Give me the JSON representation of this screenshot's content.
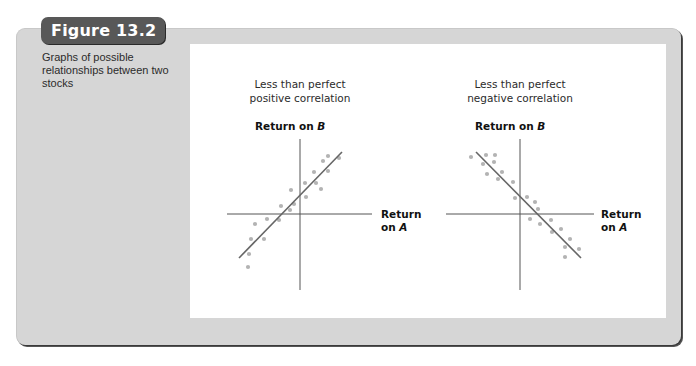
{
  "figure": {
    "badge": "Figure 13.2",
    "caption": "Graphs of possible relationships between two stocks"
  },
  "colors": {
    "frame": "#d6d6d6",
    "badge": "#585858",
    "axis": "#555555",
    "fit_line": "#666666",
    "points": "#b3b3b3"
  },
  "charts": [
    {
      "title_line1": "Less than perfect",
      "title_line2": "positive correlation",
      "ylabel_prefix": "Return on ",
      "ylabel_var": "B",
      "xlabel_line1": "Return",
      "xlabel_prefix": "on ",
      "xlabel_var": "A"
    },
    {
      "title_line1": "Less than perfect",
      "title_line2": "negative correlation",
      "ylabel_prefix": "Return on ",
      "ylabel_var": "B",
      "xlabel_line1": "Return",
      "xlabel_prefix": "on ",
      "xlabel_var": "A"
    }
  ],
  "chart_data": [
    {
      "type": "scatter",
      "title": "Less than perfect positive correlation",
      "xlabel": "Return on A",
      "ylabel": "Return on B",
      "grid": false,
      "origin_px": [
        300,
        214
      ],
      "x_axis_px": [
        227,
        372
      ],
      "y_axis_px": [
        139,
        290
      ],
      "fit_line_px": [
        [
          239,
          258
        ],
        [
          342,
          152
        ]
      ],
      "points_px": [
        [
          328,
          156
        ],
        [
          323,
          161
        ],
        [
          339,
          158
        ],
        [
          314,
          172
        ],
        [
          328,
          171
        ],
        [
          305,
          183
        ],
        [
          316,
          183
        ],
        [
          321,
          189
        ],
        [
          291,
          190
        ],
        [
          306,
          197
        ],
        [
          281,
          206
        ],
        [
          294,
          204
        ],
        [
          290,
          210
        ],
        [
          279,
          220
        ],
        [
          267,
          219
        ],
        [
          255,
          224
        ],
        [
          264,
          239
        ],
        [
          251,
          239
        ],
        [
          249,
          254
        ],
        [
          248,
          267
        ]
      ],
      "trend": "positive"
    },
    {
      "type": "scatter",
      "title": "Less than perfect negative correlation",
      "xlabel": "Return on A",
      "ylabel": "Return on B",
      "grid": false,
      "origin_px": [
        520,
        214
      ],
      "x_axis_px": [
        446,
        594
      ],
      "y_axis_px": [
        139,
        290
      ],
      "fit_line_px": [
        [
          476,
          152
        ],
        [
          581,
          258
        ]
      ],
      "points_px": [
        [
          471,
          157
        ],
        [
          486,
          155
        ],
        [
          495,
          155
        ],
        [
          483,
          164
        ],
        [
          494,
          162
        ],
        [
          487,
          174
        ],
        [
          502,
          172
        ],
        [
          498,
          179
        ],
        [
          513,
          182
        ],
        [
          515,
          198
        ],
        [
          527,
          197
        ],
        [
          535,
          202
        ],
        [
          538,
          209
        ],
        [
          530,
          219
        ],
        [
          540,
          224
        ],
        [
          551,
          220
        ],
        [
          552,
          232
        ],
        [
          561,
          229
        ],
        [
          570,
          239
        ],
        [
          565,
          247
        ],
        [
          579,
          249
        ],
        [
          565,
          257
        ]
      ],
      "trend": "negative"
    }
  ]
}
